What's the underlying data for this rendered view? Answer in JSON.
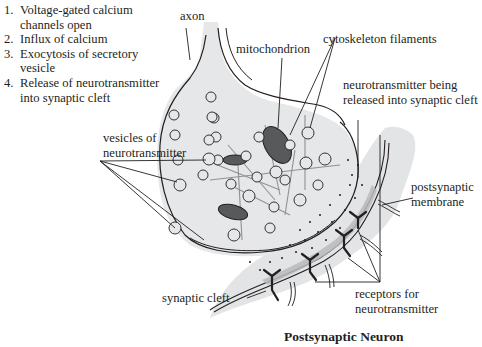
{
  "steps": [
    {
      "num": "1.",
      "text": "Voltage-gated calcium channels open"
    },
    {
      "num": "2.",
      "text": "Influx of calcium"
    },
    {
      "num": "3.",
      "text": "Exocytosis of secretory vesicle"
    },
    {
      "num": "4.",
      "text": "Release of neurotransmitter into synaptic cleft"
    }
  ],
  "labels": {
    "axon": "axon",
    "mitochondrion": "mitochondrion",
    "cytoskeleton": "cytoskeleton filaments",
    "nt_released_1": "neurotransmitter being",
    "nt_released_2": "released into synaptic cleft",
    "vesicles_1": "vesicles of",
    "vesicles_2": "neurotransmitter",
    "postsynaptic_membrane_1": "postsynaptic",
    "postsynaptic_membrane_2": "membrane",
    "synaptic_cleft": "synaptic cleft",
    "receptors_1": "receptors for",
    "receptors_2": "neurotransmitter",
    "postsynaptic_neuron": "Postsynaptic Neuron"
  },
  "colors": {
    "terminal_fill": "#e6e7e8",
    "postsynaptic_fill": "#e3e4e5",
    "receptor_zone": "#b9babc",
    "outline": "#231f20",
    "filament": "#8f9194",
    "mitochondrion": "#58595b"
  }
}
